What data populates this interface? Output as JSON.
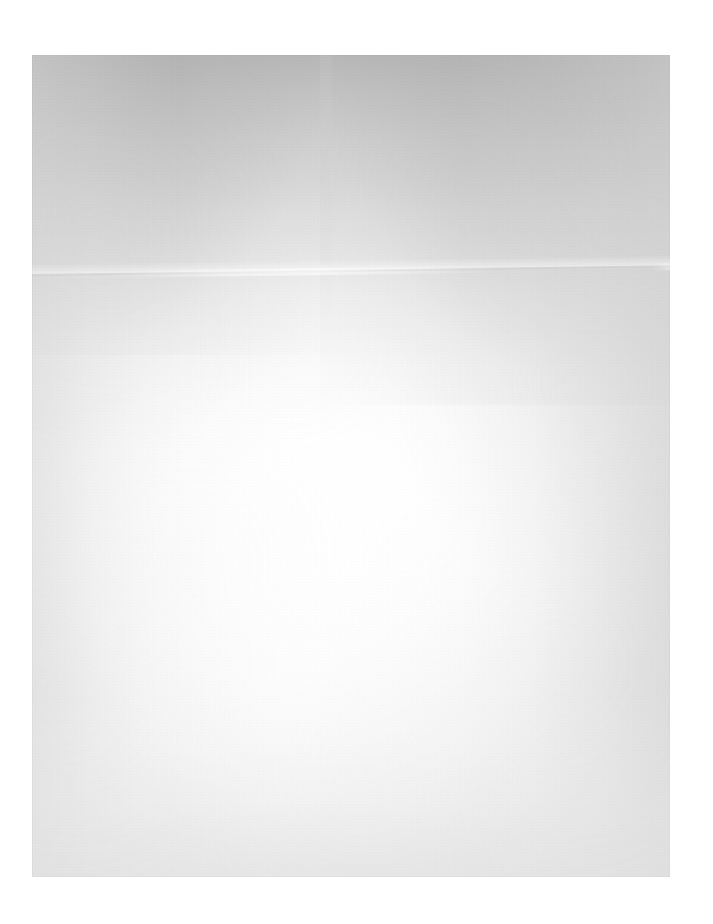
{
  "document": {
    "kind": "scanned-page",
    "content_text": "",
    "page_description": "Blank scanned sheet of paper — no printed text, headings, figures or marks.",
    "orientation": "portrait"
  },
  "canvas": {
    "width": 713,
    "height": 924,
    "background_color": "#ffffff"
  },
  "page": {
    "left": 32,
    "top": 55,
    "width": 638,
    "height": 822,
    "paper_color": "#ffffff",
    "edge_shadow_color": "#bdbdbd"
  },
  "lighting": {
    "vignette_top_color": "#b0b0b0",
    "vignette_corner_top_left_color": "#a8a8a8",
    "vignette_corner_top_right_color": "#a0a0a0",
    "vignette_left_color": "#dfdfdf",
    "vignette_right_color": "#d8d8d8",
    "vignette_bottom_color": "#e4e4e4",
    "highlight_core_color": "#ffffff"
  },
  "artifacts": {
    "fold_crease": {
      "label": "horizontal fold crease",
      "color": "#ced1d1",
      "y_left": 274,
      "y_right": 266,
      "angle_deg": -0.78
    },
    "paper_grain": {
      "label": "paper grain and mottling",
      "color": "#cacaca"
    }
  }
}
